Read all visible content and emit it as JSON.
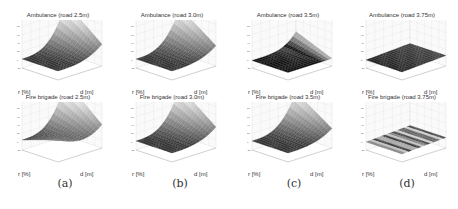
{
  "figure": {
    "captions": [
      "(a)",
      "(b)",
      "(c)",
      "(d)"
    ],
    "xlabel": "r [%]",
    "ylabel": "d [m]"
  },
  "chart_data": [
    {
      "type": "surface",
      "title": "Ambulance (road 2.5m)",
      "xlabel": "r [%]",
      "ylabel": "d [m]",
      "zlim": [
        -20,
        100
      ],
      "shape": "rising-steep-corner",
      "max_height": 0.85,
      "panel": "(a)",
      "row": 1
    },
    {
      "type": "surface",
      "title": "Ambulance (road 3.0m)",
      "xlabel": "r [%]",
      "ylabel": "d [m]",
      "zlim": [
        -20,
        100
      ],
      "shape": "rising-steep-corner",
      "max_height": 0.75,
      "panel": "(b)",
      "row": 1
    },
    {
      "type": "surface",
      "title": "Ambulance (road 3.5m)",
      "xlabel": "r [%]",
      "ylabel": "d [m]",
      "zlim": [
        -20,
        100
      ],
      "shape": "small-ridge",
      "max_height": 0.3,
      "panel": "(c)",
      "row": 1
    },
    {
      "type": "surface",
      "title": "Ambulance (road 3.75m)",
      "xlabel": "r [%]",
      "ylabel": "d [m]",
      "zlim": [
        -20,
        100
      ],
      "shape": "flat",
      "max_height": 0.05,
      "panel": "(d)",
      "row": 1
    },
    {
      "type": "surface",
      "title": "Fire brigade (road 2.5m)",
      "xlabel": "r [%]",
      "ylabel": "d [m]",
      "zlim": [
        -20,
        100
      ],
      "shape": "u-valley",
      "max_height": 0.9,
      "panel": "(a)",
      "row": 2
    },
    {
      "type": "surface",
      "title": "Fire brigade (road 3.0m)",
      "xlabel": "r [%]",
      "ylabel": "d [m]",
      "zlim": [
        -20,
        100
      ],
      "shape": "rising-steep-corner",
      "max_height": 0.8,
      "panel": "(b)",
      "row": 2
    },
    {
      "type": "surface",
      "title": "Fire brigade (road 3.5m)",
      "xlabel": "r [%]",
      "ylabel": "d [m]",
      "zlim": [
        -20,
        100
      ],
      "shape": "rising-steep-corner",
      "max_height": 0.7,
      "panel": "(c)",
      "row": 2
    },
    {
      "type": "surface",
      "title": "Fire brigade (road 3.75m)",
      "xlabel": "r [%]",
      "ylabel": "d [m]",
      "zlim": [
        -20,
        100
      ],
      "shape": "flat-striped",
      "max_height": 0.05,
      "panel": "(d)",
      "row": 2
    }
  ]
}
